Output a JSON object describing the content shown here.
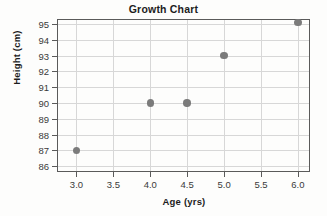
{
  "chart_data": {
    "type": "scatter",
    "title": "Growth Chart",
    "xlabel": "Age (yrs)",
    "ylabel": "Height (cm)",
    "xlim": [
      2.75,
      6.15
    ],
    "ylim": [
      85.7,
      95.25
    ],
    "grid": true,
    "legend": null,
    "x": [
      3.0,
      4.0,
      4.5,
      5.0,
      6.0
    ],
    "y": [
      87,
      90,
      90,
      93,
      95.1
    ],
    "points": [
      {
        "x": 3.0,
        "y": 87
      },
      {
        "x": 4.0,
        "y": 90
      },
      {
        "x": 4.5,
        "y": 90
      },
      {
        "x": 5.0,
        "y": 93
      },
      {
        "x": 6.0,
        "y": 95.1
      }
    ],
    "xticks": [
      3.0,
      3.5,
      4.0,
      4.5,
      5.0,
      5.5,
      6.0
    ],
    "xtick_labels": [
      "3.0",
      "3.5",
      "4.0",
      "4.5",
      "5.0",
      "5.5",
      "6.0"
    ],
    "yticks": [
      86,
      87,
      88,
      89,
      90,
      91,
      92,
      93,
      94,
      95
    ],
    "ytick_labels": [
      "86",
      "87",
      "88",
      "89",
      "90",
      "91",
      "92",
      "93",
      "94",
      "95"
    ],
    "marker_color": "#7b7b7b",
    "grid_color": "#d7d7d7",
    "axis_color": "#5a5a5a"
  }
}
